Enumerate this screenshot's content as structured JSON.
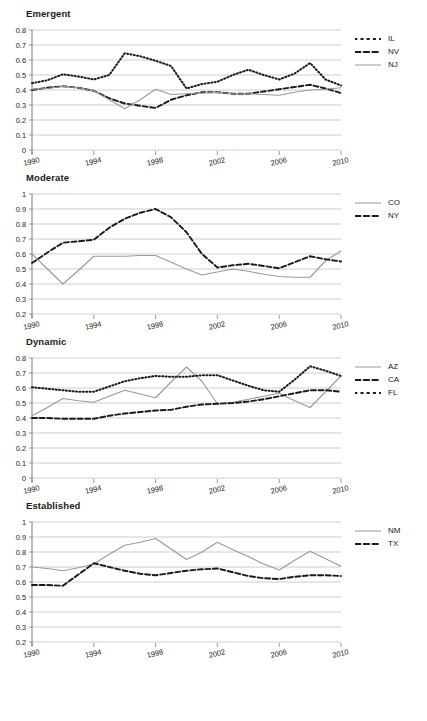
{
  "page": {
    "background": "#ffffff",
    "width": 427,
    "height": 721
  },
  "colors": {
    "solid_series": "#9a9a9a",
    "dashed_series": "#1a1a1a",
    "dotted_series": "#1a1a1a",
    "gridline": "#b8b8b8",
    "axis": "#6e6e6e",
    "text": "#1a1a1a"
  },
  "panels": [
    {
      "title": "Emergent",
      "legend": [
        {
          "label": "IL",
          "style": "dotted",
          "color": "#1a1a1a"
        },
        {
          "label": "NV",
          "style": "dashed",
          "color": "#1a1a1a"
        },
        {
          "label": "NJ",
          "style": "solid",
          "color": "#9a9a9a"
        }
      ]
    },
    {
      "title": "Moderate",
      "legend": [
        {
          "label": "CO",
          "style": "solid",
          "color": "#9a9a9a"
        },
        {
          "label": "NY",
          "style": "dashed",
          "color": "#1a1a1a"
        }
      ]
    },
    {
      "title": "Dynamic",
      "legend": [
        {
          "label": "AZ",
          "style": "solid",
          "color": "#9a9a9a"
        },
        {
          "label": "CA",
          "style": "dashed",
          "color": "#1a1a1a"
        },
        {
          "label": "FL",
          "style": "dotted",
          "color": "#1a1a1a"
        }
      ]
    },
    {
      "title": "Established",
      "legend": [
        {
          "label": "NM",
          "style": "solid",
          "color": "#9a9a9a"
        },
        {
          "label": "TX",
          "style": "dashed",
          "color": "#1a1a1a"
        }
      ]
    }
  ],
  "chart_data": [
    {
      "type": "line",
      "title": "Emergent",
      "xlabel": "",
      "ylabel": "",
      "x": [
        1990,
        1991,
        1992,
        1993,
        1994,
        1995,
        1996,
        1997,
        1998,
        1999,
        2000,
        2001,
        2002,
        2003,
        2004,
        2005,
        2006,
        2007,
        2008,
        2009,
        2010
      ],
      "xlim": [
        1990,
        2010
      ],
      "ylim": [
        0,
        0.8
      ],
      "yticks": [
        0,
        0.1,
        0.2,
        0.3,
        0.4,
        0.5,
        0.6,
        0.7,
        0.8
      ],
      "ytick_labels": [
        "0",
        "0.1",
        "0.2",
        "0.3",
        "0.4",
        "0.5",
        "0.6",
        "0.7",
        "0.8"
      ],
      "xticks": [
        1990,
        1994,
        1998,
        2002,
        2006,
        2010
      ],
      "xtick_labels": [
        "1990",
        "1994",
        "1998",
        "2002",
        "2006",
        "2010"
      ],
      "grid": true,
      "legend_position": "right",
      "series": [
        {
          "name": "IL",
          "style": "dotted",
          "color": "#1a1a1a",
          "values": [
            0.445,
            0.465,
            0.505,
            0.49,
            0.47,
            0.5,
            0.645,
            0.625,
            0.595,
            0.56,
            0.41,
            0.44,
            0.455,
            0.5,
            0.535,
            0.5,
            0.47,
            0.51,
            0.58,
            0.47,
            0.43
          ]
        },
        {
          "name": "NV",
          "style": "dashed",
          "color": "#1a1a1a",
          "values": [
            0.4,
            0.415,
            0.425,
            0.415,
            0.395,
            0.345,
            0.31,
            0.295,
            0.28,
            0.335,
            0.365,
            0.385,
            0.385,
            0.375,
            0.375,
            0.39,
            0.405,
            0.42,
            0.435,
            0.41,
            0.38
          ]
        },
        {
          "name": "NJ",
          "style": "solid",
          "color": "#9a9a9a",
          "values": [
            0.405,
            0.41,
            0.425,
            0.415,
            0.395,
            0.335,
            0.275,
            0.335,
            0.405,
            0.37,
            0.375,
            0.38,
            0.385,
            0.375,
            0.375,
            0.37,
            0.365,
            0.385,
            0.4,
            0.405,
            0.415
          ]
        }
      ]
    },
    {
      "type": "line",
      "title": "Moderate",
      "xlabel": "",
      "ylabel": "",
      "x": [
        1990,
        1991,
        1992,
        1993,
        1994,
        1995,
        1996,
        1997,
        1998,
        1999,
        2000,
        2001,
        2002,
        2003,
        2004,
        2005,
        2006,
        2007,
        2008,
        2009,
        2010
      ],
      "xlim": [
        1990,
        2010
      ],
      "ylim": [
        0.2,
        1.0
      ],
      "yticks": [
        0.2,
        0.3,
        0.4,
        0.5,
        0.6,
        0.7,
        0.8,
        0.9,
        1.0
      ],
      "ytick_labels": [
        "0.2",
        "0.3",
        "0.4",
        "0.5",
        "0.6",
        "0.7",
        "0.8",
        "0.9",
        "1"
      ],
      "xticks": [
        1990,
        1994,
        1998,
        2002,
        2006,
        2010
      ],
      "xtick_labels": [
        "1990",
        "1994",
        "1998",
        "2002",
        "2006",
        "2010"
      ],
      "grid": true,
      "legend_position": "right",
      "series": [
        {
          "name": "CO",
          "style": "solid",
          "color": "#9a9a9a",
          "values": [
            0.6,
            0.5,
            0.4,
            0.49,
            0.585,
            0.585,
            0.585,
            0.59,
            0.59,
            0.545,
            0.5,
            0.46,
            0.48,
            0.5,
            0.485,
            0.465,
            0.45,
            0.445,
            0.445,
            0.555,
            0.62
          ]
        },
        {
          "name": "NY",
          "style": "dashed",
          "color": "#1a1a1a",
          "values": [
            0.54,
            0.61,
            0.675,
            0.685,
            0.695,
            0.775,
            0.835,
            0.875,
            0.9,
            0.845,
            0.745,
            0.6,
            0.51,
            0.525,
            0.535,
            0.52,
            0.505,
            0.545,
            0.585,
            0.565,
            0.55
          ]
        }
      ]
    },
    {
      "type": "line",
      "title": "Dynamic",
      "xlabel": "",
      "ylabel": "",
      "x": [
        1990,
        1991,
        1992,
        1993,
        1994,
        1995,
        1996,
        1997,
        1998,
        1999,
        2000,
        2001,
        2002,
        2003,
        2004,
        2005,
        2006,
        2007,
        2008,
        2009,
        2010
      ],
      "xlim": [
        1990,
        2010
      ],
      "ylim": [
        0,
        0.8
      ],
      "yticks": [
        0,
        0.1,
        0.2,
        0.3,
        0.4,
        0.5,
        0.6,
        0.7,
        0.8
      ],
      "ytick_labels": [
        "0",
        "0.1",
        "0.2",
        "0.3",
        "0.4",
        "0.5",
        "0.6",
        "0.7",
        "0.8"
      ],
      "xticks": [
        1990,
        1994,
        1998,
        2002,
        2006,
        2010
      ],
      "xtick_labels": [
        "1990",
        "1994",
        "1998",
        "2002",
        "2006",
        "2010"
      ],
      "grid": true,
      "legend_position": "right",
      "series": [
        {
          "name": "AZ",
          "style": "solid",
          "color": "#9a9a9a",
          "values": [
            0.415,
            0.47,
            0.53,
            0.515,
            0.505,
            0.545,
            0.585,
            0.56,
            0.535,
            0.64,
            0.74,
            0.645,
            0.495,
            0.505,
            0.525,
            0.545,
            0.565,
            0.515,
            0.47,
            0.575,
            0.68
          ]
        },
        {
          "name": "CA",
          "style": "dashed",
          "color": "#1a1a1a",
          "values": [
            0.4,
            0.4,
            0.395,
            0.395,
            0.395,
            0.415,
            0.43,
            0.44,
            0.45,
            0.455,
            0.475,
            0.49,
            0.495,
            0.5,
            0.51,
            0.525,
            0.545,
            0.565,
            0.585,
            0.585,
            0.575
          ]
        },
        {
          "name": "FL",
          "style": "dotted",
          "color": "#1a1a1a",
          "values": [
            0.605,
            0.595,
            0.585,
            0.575,
            0.575,
            0.61,
            0.645,
            0.665,
            0.68,
            0.675,
            0.675,
            0.685,
            0.685,
            0.65,
            0.615,
            0.585,
            0.575,
            0.655,
            0.745,
            0.715,
            0.68
          ]
        }
      ]
    },
    {
      "type": "line",
      "title": "Established",
      "xlabel": "",
      "ylabel": "",
      "x": [
        1990,
        1991,
        1992,
        1993,
        1994,
        1995,
        1996,
        1997,
        1998,
        1999,
        2000,
        2001,
        2002,
        2003,
        2004,
        2005,
        2006,
        2007,
        2008,
        2009,
        2010
      ],
      "xlim": [
        1990,
        2010
      ],
      "ylim": [
        0.2,
        1.0
      ],
      "yticks": [
        0.2,
        0.3,
        0.4,
        0.5,
        0.6,
        0.7,
        0.8,
        0.9,
        1.0
      ],
      "ytick_labels": [
        "0.2",
        "0.3",
        "0.4",
        "0.5",
        "0.6",
        "0.7",
        "0.8",
        "0.9",
        "1"
      ],
      "xticks": [
        1990,
        1994,
        1998,
        2002,
        2006,
        2010
      ],
      "xtick_labels": [
        "1990",
        "1994",
        "1998",
        "2002",
        "2006",
        "2010"
      ],
      "grid": true,
      "legend_position": "right",
      "series": [
        {
          "name": "NM",
          "style": "solid",
          "color": "#9a9a9a",
          "values": [
            0.7,
            0.69,
            0.675,
            0.695,
            0.72,
            0.785,
            0.845,
            0.865,
            0.89,
            0.82,
            0.75,
            0.8,
            0.865,
            0.815,
            0.77,
            0.72,
            0.68,
            0.745,
            0.805,
            0.755,
            0.705
          ]
        },
        {
          "name": "TX",
          "style": "dashed",
          "color": "#1a1a1a",
          "values": [
            0.58,
            0.58,
            0.575,
            0.65,
            0.725,
            0.7,
            0.675,
            0.655,
            0.645,
            0.66,
            0.675,
            0.685,
            0.69,
            0.665,
            0.64,
            0.625,
            0.62,
            0.635,
            0.645,
            0.645,
            0.64
          ]
        }
      ]
    }
  ]
}
